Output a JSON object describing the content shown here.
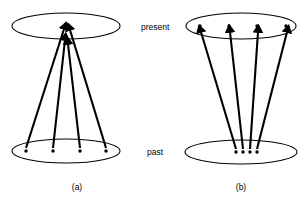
{
  "figure": {
    "background_color": "#ffffff",
    "stroke_color": "#000000",
    "labels": {
      "present": "present",
      "past": "past"
    },
    "panels": [
      {
        "id": "a",
        "caption": "(a)",
        "caption_x": 77,
        "caption_y": 190,
        "description": "many past states converge onto one present state",
        "mapping": "many-to-one",
        "arrow_count": 4,
        "top_ellipse": {
          "cx": 66,
          "cy": 26,
          "rx": 54,
          "ry": 13
        },
        "bottom_ellipse": {
          "cx": 66,
          "cy": 151,
          "rx": 54,
          "ry": 12
        },
        "present_nodes": [
          {
            "x": 66,
            "y": 24
          }
        ],
        "past_nodes": [
          {
            "x": 26,
            "y": 151
          },
          {
            "x": 53,
            "y": 151
          },
          {
            "x": 80,
            "y": 151
          },
          {
            "x": 106,
            "y": 151
          }
        ],
        "arrows": [
          {
            "x1": 26,
            "y1": 148,
            "x2": 64,
            "y2": 29
          },
          {
            "x1": 53,
            "y1": 148,
            "x2": 65,
            "y2": 40
          },
          {
            "x1": 80,
            "y1": 148,
            "x2": 68,
            "y2": 44
          },
          {
            "x1": 106,
            "y1": 148,
            "x2": 70,
            "y2": 30
          }
        ]
      },
      {
        "id": "b",
        "caption": "(b)",
        "caption_x": 241,
        "caption_y": 190,
        "description": "one cluster of past states diverges onto many present states",
        "mapping": "one-to-many",
        "arrow_count": 4,
        "top_ellipse": {
          "cx": 241,
          "cy": 26,
          "rx": 55,
          "ry": 13
        },
        "bottom_ellipse": {
          "cx": 241,
          "cy": 152,
          "rx": 56,
          "ry": 12
        },
        "present_nodes": [
          {
            "x": 200,
            "y": 26
          },
          {
            "x": 229,
            "y": 26
          },
          {
            "x": 257,
            "y": 26
          },
          {
            "x": 286,
            "y": 26
          }
        ],
        "past_nodes": [
          {
            "x": 236,
            "y": 152
          },
          {
            "x": 243,
            "y": 152
          },
          {
            "x": 250,
            "y": 152
          },
          {
            "x": 257,
            "y": 152
          }
        ],
        "arrows": [
          {
            "x1": 236,
            "y1": 149,
            "x2": 201,
            "y2": 32
          },
          {
            "x1": 243,
            "y1": 149,
            "x2": 230,
            "y2": 32
          },
          {
            "x1": 250,
            "y1": 149,
            "x2": 258,
            "y2": 32
          },
          {
            "x1": 257,
            "y1": 149,
            "x2": 287,
            "y2": 32
          }
        ]
      }
    ],
    "label_positions": {
      "present_x": 141,
      "present_y": 30,
      "past_x": 147,
      "past_y": 155
    }
  }
}
